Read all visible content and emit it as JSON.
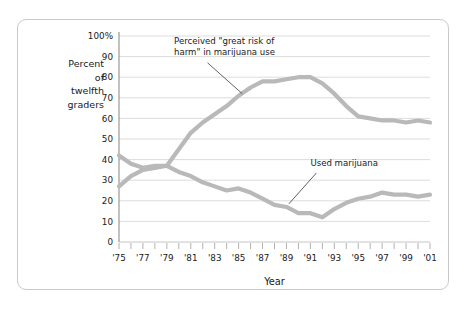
{
  "chart_data": {
    "type": "line",
    "title": "",
    "xlabel": "Year",
    "ylabel": "Percent of twelfth graders",
    "ylabel_lines": [
      "Percent",
      "of",
      "twelfth",
      "graders"
    ],
    "xlim": [
      1975,
      2001
    ],
    "ylim": [
      0,
      100
    ],
    "grid": true,
    "legend_position": "inline-annotations",
    "y_ticks": [
      0,
      10,
      20,
      30,
      40,
      50,
      60,
      70,
      80,
      90,
      100
    ],
    "y_tick_labels": [
      "0",
      "10",
      "20",
      "30",
      "40",
      "50",
      "60",
      "70",
      "80",
      "90",
      "100%"
    ],
    "x_ticks": [
      1975,
      1976,
      1977,
      1978,
      1979,
      1980,
      1981,
      1982,
      1983,
      1984,
      1985,
      1986,
      1987,
      1988,
      1989,
      1990,
      1991,
      1992,
      1993,
      1994,
      1995,
      1996,
      1997,
      1998,
      1999,
      2000,
      2001
    ],
    "x_tick_labels": [
      "'75",
      "",
      "'77",
      "",
      "'79",
      "",
      "'81",
      "",
      "'83",
      "",
      "'85",
      "",
      "'87",
      "",
      "'89",
      "",
      "'91",
      "",
      "'93",
      "",
      "'95",
      "",
      "'97",
      "",
      "'99",
      "",
      "'01"
    ],
    "x": [
      1975,
      1976,
      1977,
      1978,
      1979,
      1980,
      1981,
      1982,
      1983,
      1984,
      1985,
      1986,
      1987,
      1988,
      1989,
      1990,
      1991,
      1992,
      1993,
      1994,
      1995,
      1996,
      1997,
      1998,
      1999,
      2000,
      2001
    ],
    "series": [
      {
        "name": "Perceived \"great risk of harm\" in marijuana use",
        "color": "#b9b9b9",
        "values": [
          27,
          32,
          35,
          36,
          37,
          45,
          53,
          58,
          62,
          66,
          71,
          75,
          78,
          78,
          79,
          80,
          80,
          77,
          72,
          66,
          61,
          60,
          59,
          59,
          58,
          59,
          58
        ]
      },
      {
        "name": "Used marijuana",
        "color": "#b9b9b9",
        "values": [
          42,
          38,
          36,
          37,
          37,
          34,
          32,
          29,
          27,
          25,
          26,
          24,
          21,
          18,
          17,
          14,
          14,
          12,
          16,
          19,
          21,
          22,
          24,
          23,
          23,
          22,
          23
        ]
      }
    ],
    "annotations": [
      {
        "name": "risk-annotation",
        "text_lines": [
          "Perceived \"great risk of",
          "harm\" in marijuana use"
        ],
        "text_x": 1979.6,
        "text_y": 96,
        "leader_from_x": 1982.4,
        "leader_from_y": 87,
        "leader_to_x": 1985.3,
        "leader_to_y": 72
      },
      {
        "name": "usage-annotation",
        "text_lines": [
          "Used marijuana"
        ],
        "text_x": 1991.0,
        "text_y": 37,
        "leader_from_x": 1991.5,
        "leader_from_y": 33.5,
        "leader_to_x": 1989.2,
        "leader_to_y": 18.5
      }
    ]
  }
}
